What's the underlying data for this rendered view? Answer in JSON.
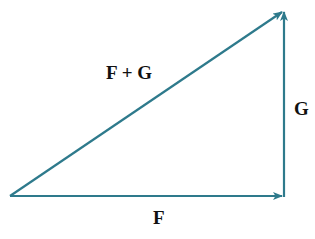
{
  "diagram": {
    "colors": {
      "vector": "#2e7a8c",
      "label": "#111111",
      "background": "#ffffff"
    },
    "points": {
      "origin": [
        10,
        196
      ],
      "corner": [
        284,
        196
      ],
      "tip": [
        284,
        10
      ]
    },
    "vectors": [
      {
        "id": "F",
        "label": "F",
        "from": "origin",
        "to": "corner"
      },
      {
        "id": "G",
        "label": "G",
        "from": "corner",
        "to": "tip"
      },
      {
        "id": "F+G",
        "label": "F + G",
        "from": "origin",
        "to": "tip"
      }
    ],
    "labels": {
      "sum": "F + G",
      "g": "G",
      "f": "F"
    }
  }
}
